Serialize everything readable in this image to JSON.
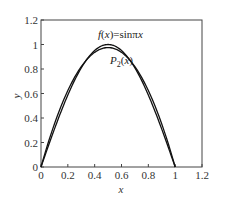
{
  "chart_data": {
    "type": "line",
    "title": "",
    "xlabel": "x",
    "ylabel": "y",
    "xlim": [
      0,
      1.2
    ],
    "ylim": [
      0,
      1.2
    ],
    "xticks": [
      "0",
      "0.2",
      "0.4",
      "0.6",
      "0.8",
      "1",
      "1.2"
    ],
    "yticks": [
      "0",
      "0.2",
      "0.4",
      "0.6",
      "0.8",
      "1",
      "1.2"
    ],
    "grid": false,
    "legend": "none (inline annotations)",
    "series": [
      {
        "name": "f(x)=sinπx",
        "x": [
          0,
          0.1,
          0.2,
          0.3,
          0.4,
          0.5,
          0.6,
          0.7,
          0.8,
          0.9,
          1.0
        ],
        "y": [
          0,
          0.309,
          0.588,
          0.809,
          0.951,
          1.0,
          0.951,
          0.809,
          0.588,
          0.309,
          0
        ]
      },
      {
        "name": "P2(x)",
        "x": [
          0,
          0.1,
          0.2,
          0.3,
          0.4,
          0.5,
          0.6,
          0.7,
          0.8,
          0.9,
          1.0
        ],
        "y": [
          0,
          0.351,
          0.624,
          0.819,
          0.936,
          0.975,
          0.936,
          0.819,
          0.624,
          0.351,
          0
        ]
      }
    ],
    "annotations": [
      {
        "text_parts": [
          "f",
          "(",
          "x",
          ")=sinπ",
          "x"
        ],
        "position": [
          0.47,
          1.07
        ]
      },
      {
        "text_parts": [
          "P",
          "2",
          "(",
          "x",
          ")"
        ],
        "position": [
          0.52,
          0.85
        ]
      }
    ]
  }
}
